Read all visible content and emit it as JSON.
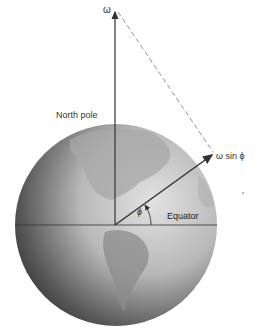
{
  "diagram": {
    "labels": {
      "omega": "ω",
      "north_pole": "North pole",
      "omega_sin_phi": "ω sin ϕ",
      "equator": "Equator",
      "phi": "ϕ"
    },
    "colors": {
      "globe_light": "#d9d9d9",
      "globe_dark": "#3a3a3a",
      "land": "#9a9a9a",
      "vector": "#333333",
      "dashed": "#777777"
    }
  }
}
